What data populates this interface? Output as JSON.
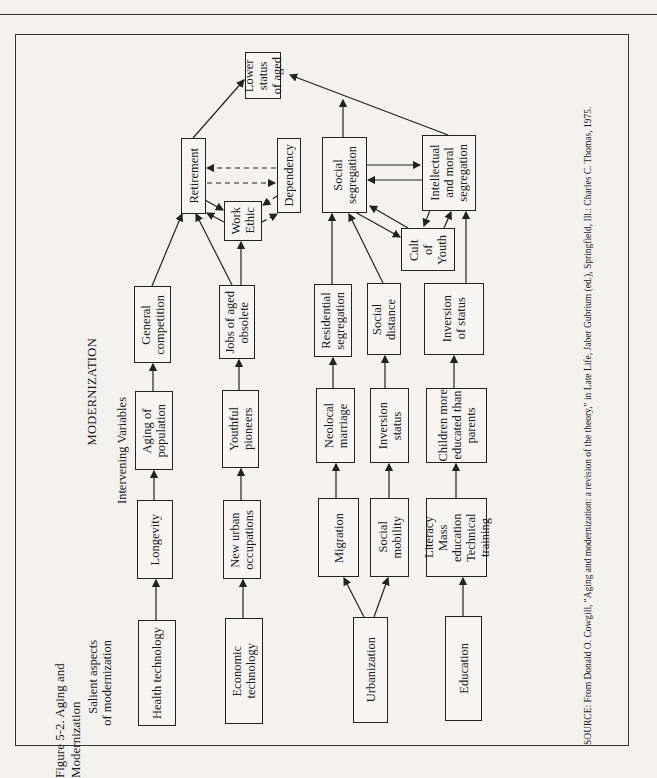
{
  "figure": {
    "caption": "Figure 5-2.  Aging and Modernization",
    "title": "MODERNIZATION",
    "column_headers": {
      "salient": "Salient aspects\nof modernization",
      "intervening": "Intervening Variables"
    },
    "source": "SOURCE: From Donald O. Cowgill, \"Aging and modernization: a revision of the theory,\" in Late Life, Jaber Gubrium (ed.), Springfield, Ill.: Charles C. Thomas, 1975."
  },
  "nodes": {
    "lower_status": "Lower\nstatus\nof aged",
    "retirement": "Retirement",
    "work_ethic": "Work\nEthic",
    "dependency": "Dependency",
    "social_segregation": "Social\nsegregation",
    "intellectual_moral_segregation": "Intellectual\nand moral\nsegregation",
    "cult_of_youth": "Cult\nof\nYouth",
    "general_competition": "General\ncompetition",
    "jobs_obsolete": "Jobs of aged\nobsolete",
    "residential_segregation": "Residential\nsegregation",
    "social_distance": "Social\ndistance",
    "inversion_of_status": "Inversion\nof status",
    "aging_population": "Aging of\npopulation",
    "youthful_pioneers": "Youthful\npioneers",
    "neolocal_marriage": "Neolocal\nmarriage",
    "inversion_status": "Inversion\nstatus",
    "children_educated": "Children more\neducated than\nparents",
    "longevity": "Longevity",
    "new_urban_occupations": "New urban\noccupations",
    "migration": "Migration",
    "social_mobility": "Social\nmobility",
    "literacy": "Literacy\nMass education\nTechnical\ntraining",
    "health_technology": "Health technology",
    "economic_technology": "Economic\ntechnology",
    "urbanization": "Urbanization",
    "education": "Education"
  },
  "edges": [
    [
      "health_technology",
      "longevity"
    ],
    [
      "longevity",
      "aging_population"
    ],
    [
      "aging_population",
      "general_competition"
    ],
    [
      "general_competition",
      "retirement"
    ],
    [
      "economic_technology",
      "new_urban_occupations"
    ],
    [
      "new_urban_occupations",
      "youthful_pioneers"
    ],
    [
      "youthful_pioneers",
      "jobs_obsolete"
    ],
    [
      "jobs_obsolete",
      "retirement"
    ],
    [
      "jobs_obsolete",
      "work_ethic"
    ],
    [
      "urbanization",
      "migration"
    ],
    [
      "urbanization",
      "social_mobility"
    ],
    [
      "migration",
      "neolocal_marriage"
    ],
    [
      "neolocal_marriage",
      "residential_segregation"
    ],
    [
      "residential_segregation",
      "social_segregation"
    ],
    [
      "social_mobility",
      "inversion_status"
    ],
    [
      "inversion_status",
      "social_distance"
    ],
    [
      "social_distance",
      "social_segregation"
    ],
    [
      "education",
      "literacy"
    ],
    [
      "literacy",
      "children_educated"
    ],
    [
      "children_educated",
      "inversion_of_status"
    ],
    [
      "inversion_of_status",
      "intellectual_moral_segregation"
    ],
    [
      "retirement",
      "work_ethic"
    ],
    [
      "work_ethic",
      "retirement"
    ],
    [
      "retirement",
      "dependency",
      "dashed"
    ],
    [
      "dependency",
      "retirement",
      "dashed"
    ],
    [
      "work_ethic",
      "dependency",
      "dashed"
    ],
    [
      "dependency",
      "work_ethic",
      "dashed"
    ],
    [
      "social_segregation",
      "intellectual_moral_segregation"
    ],
    [
      "intellectual_moral_segregation",
      "social_segregation"
    ],
    [
      "social_segregation",
      "cult_of_youth"
    ],
    [
      "cult_of_youth",
      "social_segregation"
    ],
    [
      "cult_of_youth",
      "intellectual_moral_segregation"
    ],
    [
      "intellectual_moral_segregation",
      "cult_of_youth"
    ],
    [
      "retirement",
      "lower_status"
    ],
    [
      "social_segregation",
      "lower_status"
    ],
    [
      "intellectual_moral_segregation",
      "lower_status"
    ]
  ]
}
